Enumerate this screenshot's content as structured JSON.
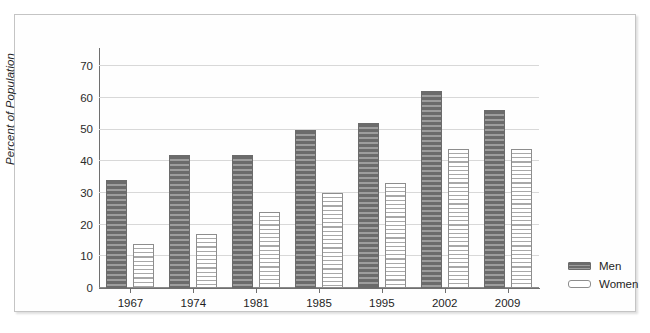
{
  "chart_data": {
    "type": "bar",
    "title": "",
    "xlabel": "",
    "ylabel": "Percent of Population",
    "categories": [
      "1967",
      "1974",
      "1981",
      "1985",
      "1995",
      "2002",
      "2009"
    ],
    "series": [
      {
        "name": "Men",
        "values": [
          34,
          42,
          42,
          50,
          52,
          62,
          56
        ]
      },
      {
        "name": "Women",
        "values": [
          14,
          17,
          24,
          30,
          33,
          44,
          44
        ]
      }
    ],
    "ylim": [
      0,
      73.5
    ],
    "yticks": [
      0,
      10,
      20,
      30,
      40,
      50,
      60,
      70
    ],
    "ytick_labels": [
      "0",
      "10",
      "20",
      "30",
      "40",
      "50",
      "60",
      "70"
    ],
    "grid": true,
    "grid_axis": "y",
    "legend_position": "bottom-right",
    "colors": {
      "men_fill": "#7c7c7c",
      "men_stripe": "#6b6b6b",
      "women_fill": "#ffffff",
      "women_stripe": "#a8a8a8",
      "gridline": "#d8d8d8",
      "axis": "#6f6f6f",
      "text": "#1f1f1f",
      "frame": "#c4c4c4",
      "background": "#ffffff"
    }
  },
  "legend": {
    "items": [
      {
        "label": "Men",
        "kind": "men"
      },
      {
        "label": "Women",
        "kind": "women"
      }
    ]
  }
}
